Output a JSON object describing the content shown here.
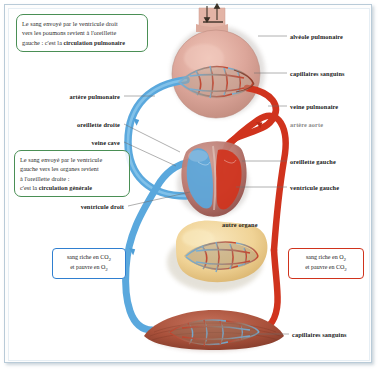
{
  "diagram": {
    "colors": {
      "deoxygenated_blue": "#5aa8dd",
      "oxygenated_red": "#d0331d",
      "lung_pink": "#dca69a",
      "organ_yellow": "#f2d79a",
      "muscle_brown": "#a8503a",
      "callout_green": "#4a8f55",
      "frame_blue": "#b9cbd8"
    }
  },
  "callouts": {
    "pulmonary": {
      "line1": "Le sang envoyé par le ventricule droit",
      "line2": "vers les poumons revient à l'oreillette",
      "line3_plain": "gauche : c'est la ",
      "line3_bold": "circulation pulmonaire"
    },
    "general": {
      "line1": "Le sang envoyé par le ventricule",
      "line2": "gauche vers les organes revient",
      "line3": "à l'oreillette droite :",
      "line4_plain": "c'est la ",
      "line4_bold": "circulation générale"
    }
  },
  "legends": {
    "deoxygenated": {
      "line1": "sang riche en CO",
      "sub1": "2",
      "line2": "et pauvre en O",
      "sub2": "2"
    },
    "oxygenated": {
      "line1": "sang riche en O",
      "sub1": "2",
      "line2": "et pauvre en CO",
      "sub2": "2"
    }
  },
  "labels": {
    "alveole_pulmonaire": "alvéole pulmonaire",
    "capillaires_sanguins_top": "capillaires sanguins",
    "veine_pulmonaire": "veine pulmonaire",
    "artere_aorte": "artère aorte",
    "oreillette_gauche": "oreillette gauche",
    "ventricule_gauche": "ventricule gauche",
    "capillaires_sanguins_bottom": "capillaires sanguins",
    "artere_pulmonaire": "artère pulmonaire",
    "oreillette_droite": "oreillette droite",
    "veine_cave": "veine cave",
    "ventricule_droit": "ventricule droit",
    "autre_organe": "autre organe"
  }
}
